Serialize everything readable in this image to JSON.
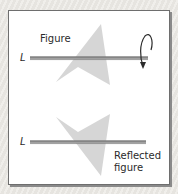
{
  "diagram": {
    "type": "reflection-illustration",
    "top_panel": {
      "figure_label": "Figure",
      "axis_label": "L",
      "rotation_icon": "curved-rotation-arrow"
    },
    "bottom_panel": {
      "axis_label": "L",
      "reflected_label_line1": "Reflected",
      "reflected_label_line2": "figure"
    },
    "colors": {
      "shape_fill": "#d4d4d4",
      "axis_line": "#8c8c8c",
      "axis_highlight": "#5a5a5a",
      "frame_border": "#6e6e6e",
      "text": "#2b2b2b"
    }
  }
}
